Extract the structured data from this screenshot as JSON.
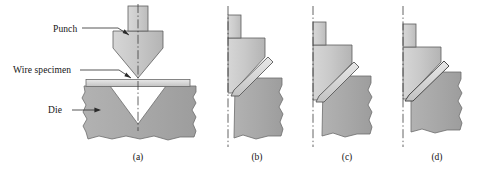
{
  "figure": {
    "background": "#ffffff",
    "colors": {
      "punch_fill": "#c6c6c6",
      "punch_shank_fill": "#cfcfcf",
      "die_fill": "#a9a9a9",
      "wire_fill": "#dcdcdc",
      "outline": "#4a4a4a",
      "centerline": "#3c3c3c",
      "leader": "#2b2b2b",
      "text": "#141414"
    }
  },
  "labels": [
    {
      "id": "punch",
      "text": "Punch",
      "x": 53,
      "y": 29
    },
    {
      "id": "wire-specimen",
      "text": "Wire specimen",
      "x": 13,
      "y": 70
    },
    {
      "id": "die",
      "text": "Die",
      "x": 58,
      "y": 110
    }
  ],
  "captions": [
    {
      "id": "a",
      "text": "(a)",
      "cx": 138,
      "y": 157
    },
    {
      "id": "b",
      "text": "(b)",
      "cx": 257,
      "y": 157
    },
    {
      "id": "c",
      "text": "(c)",
      "cx": 347,
      "y": 157
    },
    {
      "id": "d",
      "text": "(d)",
      "cx": 437,
      "y": 157
    }
  ],
  "panels": [
    {
      "id": "a",
      "view": "full-symmetric",
      "stage": "Punch above wire, wire flat on die",
      "parts": [
        "punch-shank",
        "punch-body",
        "wire-specimen",
        "die-block",
        "die-v-groove",
        "centerline"
      ]
    },
    {
      "id": "b",
      "view": "half-section",
      "stage": "Punch descending, wire begins to bend",
      "parts": [
        "punch-shank",
        "punch-body",
        "wire-specimen",
        "die-block",
        "centerline"
      ]
    },
    {
      "id": "c",
      "view": "half-section",
      "stage": "Punch lower, wire bent further",
      "parts": [
        "punch-shank",
        "punch-body",
        "wire-specimen",
        "die-block",
        "centerline"
      ]
    },
    {
      "id": "d",
      "view": "half-section",
      "stage": "Punch bottomed, wire fully formed against die",
      "parts": [
        "punch-shank",
        "punch-body",
        "wire-specimen",
        "die-block",
        "centerline"
      ]
    }
  ]
}
